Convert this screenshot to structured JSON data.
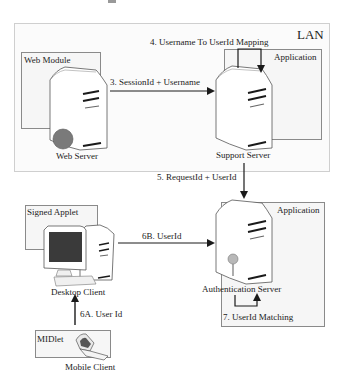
{
  "diagram": {
    "type": "architecture",
    "zones": {
      "lan": {
        "label": "LAN"
      },
      "web_module": {
        "label": "Web Module"
      },
      "application_support": {
        "label": "Application"
      },
      "application_auth": {
        "label": "Application"
      },
      "signed_applet": {
        "label": "Signed Applet"
      },
      "midlet": {
        "label": "MIDlet"
      }
    },
    "nodes": {
      "web_server": {
        "label": "Web Server",
        "icon": "server-icon"
      },
      "support_server": {
        "label": "Support Server",
        "icon": "server-icon"
      },
      "auth_server": {
        "label": "Authentication Server",
        "icon": "server-key-icon"
      },
      "desktop_client": {
        "label": "Desktop Client",
        "icon": "desktop-computer-icon"
      },
      "mobile_client": {
        "label": "Mobile Client",
        "icon": "mobile-phone-icon"
      }
    },
    "edges": {
      "e3": {
        "label": "3.  SessionId + Username",
        "from": "Web Server",
        "to": "Support Server"
      },
      "e4": {
        "label": "4. Username To UserId Mapping",
        "from": "Support Server",
        "to": "Support Server"
      },
      "e5": {
        "label": "5. RequestId + UserId",
        "from": "Support Server",
        "to": "Authentication Server"
      },
      "e6a": {
        "label": "6A. User Id",
        "from": "Mobile Client",
        "to": "Desktop Client"
      },
      "e6b": {
        "label": "6B. UserId",
        "from": "Desktop Client",
        "to": "Authentication Server"
      },
      "e7": {
        "label": "7. UserId Matching",
        "from": "Authentication Server",
        "to": "Authentication Server"
      }
    },
    "colors": {
      "line": "#1a1a1a",
      "box_border": "#8a8a8a",
      "box_fill": "#f6f6f6",
      "server_fill": "#ffffff",
      "web_badge": "#7a7a7a",
      "key": "#b8b8b8",
      "screen": "#3a3a3a"
    }
  }
}
